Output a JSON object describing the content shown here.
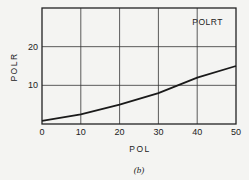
{
  "chart_data": {
    "type": "line",
    "title": "",
    "xlabel": "POL",
    "ylabel": "POLR",
    "caption": "(b)",
    "annotation": "POLRT",
    "xlim": [
      0,
      50
    ],
    "ylim": [
      0,
      30
    ],
    "xticks": [
      0,
      10,
      20,
      30,
      40,
      50
    ],
    "yticks": [
      10,
      20
    ],
    "grid": true,
    "series": [
      {
        "name": "POLRT",
        "x": [
          0,
          10,
          20,
          30,
          35,
          40,
          50
        ],
        "y": [
          0.8,
          2.5,
          5,
          8,
          10,
          12,
          15
        ]
      }
    ]
  }
}
